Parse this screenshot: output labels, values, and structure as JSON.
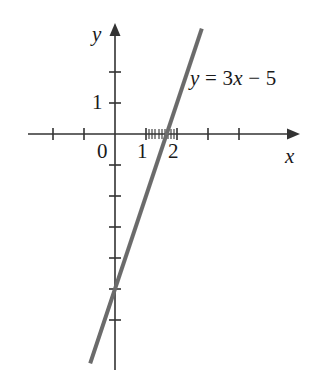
{
  "figure": {
    "kind": "cartesian-line-graph",
    "background_color": "#ffffff",
    "width": 320,
    "height": 385
  },
  "axes": {
    "x_axis_label": "x",
    "y_axis_label": "y",
    "origin_label": "0",
    "axis_color": "#333333",
    "origin_px": {
      "x": 115,
      "y": 134
    },
    "unit_px": 31,
    "x_range": [
      -2.7,
      5.2
    ],
    "y_range": [
      -7.6,
      3.2
    ],
    "x_tick_values": [
      -2,
      -1,
      1,
      2,
      3,
      4
    ],
    "y_tick_values": [
      2,
      1,
      -1,
      -2,
      -3,
      -4,
      -5,
      -6
    ],
    "x_tick_labels": [
      {
        "value": 1,
        "text": "1"
      },
      {
        "value": 2,
        "text": "2"
      }
    ],
    "y_tick_labels": [
      {
        "value": 1,
        "text": "1"
      }
    ],
    "minor_x_ticks": [
      1.0,
      1.1,
      1.2,
      1.3,
      1.4,
      1.5,
      1.6,
      1.7,
      1.8,
      1.9,
      2.0
    ],
    "grid": false,
    "arrowheads": [
      "x-positive",
      "y-positive"
    ]
  },
  "annotations": {
    "equation": {
      "lhs": "y",
      "equals": "=",
      "slope_term": "3x",
      "minus": "−",
      "intercept_term": "5",
      "full_text": "y = 3x − 5"
    }
  },
  "chart_data": {
    "type": "line",
    "title": "",
    "xlabel": "x",
    "ylabel": "y",
    "xlim": [
      -2.7,
      5.2
    ],
    "ylim": [
      -7.6,
      3.2
    ],
    "grid": false,
    "legend": "none",
    "series": [
      {
        "name": "y = 3x − 5",
        "equation": "y = 3x - 5",
        "slope": 3,
        "y_intercept": -5,
        "x_intercept": 1.6667,
        "color": "#6b6b6b",
        "line_width_px": 4,
        "x": [
          -0.8,
          2.8
        ],
        "y": [
          -7.4,
          3.4
        ],
        "points": [
          {
            "x": -0.8,
            "y": -7.4
          },
          {
            "x": 0,
            "y": -5
          },
          {
            "x": 1.6667,
            "y": 0
          },
          {
            "x": 2,
            "y": 1
          },
          {
            "x": 2.8,
            "y": 3.4
          }
        ]
      }
    ],
    "x_ticks": [
      -2,
      -1,
      0,
      1,
      2,
      3,
      4
    ],
    "y_ticks": [
      2,
      1,
      0,
      -1,
      -2,
      -3,
      -4,
      -5,
      -6
    ],
    "x_tick_labels_shown": [
      "0",
      "1",
      "2"
    ],
    "y_tick_labels_shown": [
      "1"
    ]
  }
}
